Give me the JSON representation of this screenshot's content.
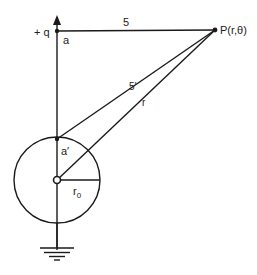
{
  "diagram": {
    "labels": {
      "charge": "+ q",
      "charge_distance": "a",
      "image_distance": "a′",
      "distance_s": "5",
      "distance_s_prime": "5′",
      "distance_r": "r",
      "radius": "r",
      "radius_sub": "0",
      "point": "P(r,θ)"
    },
    "elements": [
      "point-charge",
      "image-charge",
      "grounded-sphere",
      "field-point-P",
      "ground-symbol"
    ],
    "colors": {
      "stroke": "#1a1a1a",
      "text": "#222222"
    }
  }
}
